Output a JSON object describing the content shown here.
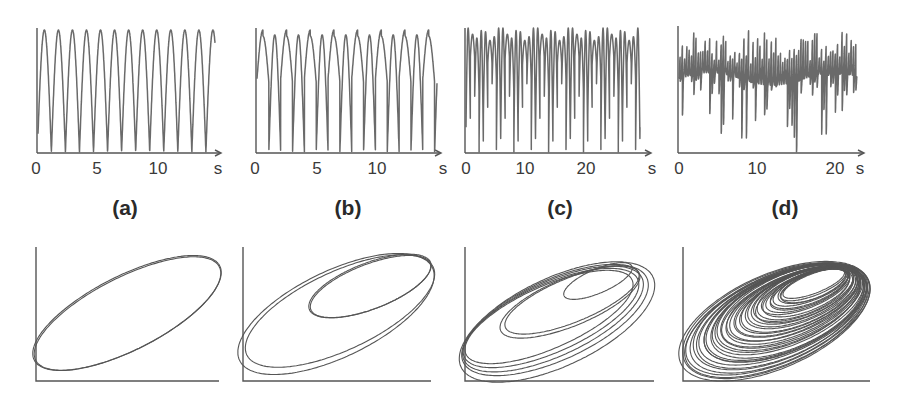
{
  "chart_data": [
    {
      "type": "line",
      "panel": "(a)",
      "title": "",
      "xlabel": "s",
      "ylabel": "",
      "x_ticks": [
        "0",
        "5",
        "10"
      ],
      "x_unit": "s",
      "xlim": [
        0,
        15
      ],
      "dynamics": "period-1",
      "oscillation_period_s": 1.15,
      "peaks_visible": 13
    },
    {
      "type": "line",
      "panel": "(b)",
      "title": "",
      "xlabel": "s",
      "ylabel": "",
      "x_ticks": [
        "0",
        "5",
        "10"
      ],
      "x_unit": "s",
      "xlim": [
        0,
        15
      ],
      "dynamics": "period-2",
      "oscillation_period_s": 1.9,
      "peaks_visible": 16
    },
    {
      "type": "line",
      "panel": "(c)",
      "title": "",
      "xlabel": "s",
      "ylabel": "",
      "x_ticks": [
        "0",
        "10",
        "20"
      ],
      "x_unit": "s",
      "xlim": [
        0,
        30
      ],
      "dynamics": "period-4"
    },
    {
      "type": "line",
      "panel": "(d)",
      "title": "",
      "xlabel": "s",
      "ylabel": "",
      "x_ticks": [
        "0",
        "10",
        "20"
      ],
      "x_unit": "s",
      "xlim": [
        0,
        24
      ],
      "dynamics": "chaotic"
    },
    {
      "type": "line",
      "panel": "(a) phase portrait",
      "dynamics": "period-1 limit cycle",
      "loops": 1
    },
    {
      "type": "line",
      "panel": "(b) phase portrait",
      "dynamics": "period-2 limit cycle",
      "loops": 2
    },
    {
      "type": "line",
      "panel": "(c) phase portrait",
      "dynamics": "period-4 limit cycle",
      "loops": 4
    },
    {
      "type": "line",
      "panel": "(d) phase portrait",
      "dynamics": "chaotic attractor",
      "loops": 40
    }
  ],
  "labels": {
    "a": "(a)",
    "b": "(b)",
    "c": "(c)",
    "d": "(d)"
  },
  "axis_unit": "s"
}
